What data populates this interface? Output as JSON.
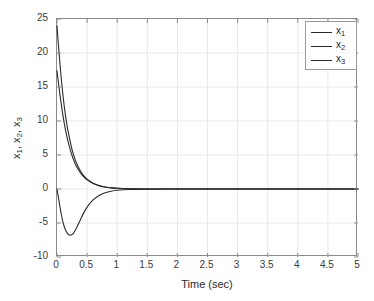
{
  "chart_data": {
    "type": "line",
    "title": "",
    "xlabel": "Time (sec)",
    "ylabel": "x_1, x_2, x_3",
    "xlim": [
      0,
      5
    ],
    "ylim": [
      -10,
      25
    ],
    "xticks": [
      0,
      0.5,
      1,
      1.5,
      2,
      2.5,
      3,
      3.5,
      4,
      4.5,
      5
    ],
    "xtick_labels": [
      "0",
      "0.5",
      "1",
      "1.5",
      "2",
      "2.5",
      "3",
      "3.5",
      "4",
      "4.5",
      "5"
    ],
    "yticks": [
      -10,
      -5,
      0,
      5,
      10,
      15,
      20,
      25
    ],
    "ytick_labels": [
      "-10",
      "-5",
      "0",
      "5",
      "10",
      "15",
      "20",
      "25"
    ],
    "grid": true,
    "legend_position": "top-right",
    "series": [
      {
        "name": "x_1",
        "label_base": "x",
        "label_sub": "1",
        "color": "#2a2a2a",
        "x": [
          0,
          0.02,
          0.05,
          0.08,
          0.12,
          0.16,
          0.2,
          0.25,
          0.3,
          0.35,
          0.4,
          0.45,
          0.5,
          0.6,
          0.7,
          0.8,
          0.9,
          1.0,
          1.2,
          1.5,
          2.0,
          2.5,
          3.0,
          3.5,
          4.0,
          4.5,
          5.0
        ],
        "values": [
          24.0,
          21.6,
          18.3,
          15.4,
          12.2,
          9.7,
          7.8,
          5.8,
          4.35,
          3.3,
          2.5,
          1.9,
          1.45,
          0.85,
          0.5,
          0.3,
          0.18,
          0.1,
          0.04,
          0.01,
          0.0,
          0.0,
          0.0,
          0.0,
          0.0,
          0.0,
          0.0
        ]
      },
      {
        "name": "x_2",
        "label_base": "x",
        "label_sub": "2",
        "color": "#2a2a2a",
        "x": [
          0,
          0.02,
          0.05,
          0.08,
          0.12,
          0.16,
          0.2,
          0.25,
          0.3,
          0.35,
          0.4,
          0.45,
          0.5,
          0.6,
          0.7,
          0.8,
          0.9,
          1.0,
          1.2,
          1.5,
          2.0,
          2.5,
          3.0,
          3.5,
          4.0,
          4.5,
          5.0
        ],
        "values": [
          17.4,
          15.9,
          13.8,
          11.9,
          9.7,
          7.9,
          6.4,
          4.9,
          3.75,
          2.9,
          2.25,
          1.75,
          1.35,
          0.8,
          0.48,
          0.29,
          0.17,
          0.1,
          0.04,
          0.01,
          0.0,
          0.0,
          0.0,
          0.0,
          0.0,
          0.0,
          0.0
        ]
      },
      {
        "name": "x_3",
        "label_base": "x",
        "label_sub": "3",
        "color": "#2a2a2a",
        "x": [
          0,
          0.03,
          0.06,
          0.1,
          0.14,
          0.18,
          0.22,
          0.27,
          0.32,
          0.38,
          0.45,
          0.52,
          0.6,
          0.7,
          0.8,
          0.9,
          1.0,
          1.2,
          1.5,
          2.0,
          2.5,
          3.0,
          3.5,
          4.0,
          4.5,
          5.0
        ],
        "values": [
          0.0,
          -1.6,
          -3.2,
          -4.9,
          -6.0,
          -6.6,
          -6.8,
          -6.55,
          -5.8,
          -4.7,
          -3.4,
          -2.4,
          -1.6,
          -0.95,
          -0.55,
          -0.32,
          -0.19,
          -0.07,
          -0.02,
          0.0,
          0.0,
          0.0,
          0.0,
          0.0,
          0.0,
          0.0
        ]
      }
    ],
    "annotations": []
  },
  "axis": {
    "xlabel_text": "Time (sec)"
  },
  "legend": {
    "entries": [
      {
        "base": "x",
        "sub": "1"
      },
      {
        "base": "x",
        "sub": "2"
      },
      {
        "base": "x",
        "sub": "3"
      }
    ]
  },
  "style": {
    "axis_color": "#8a8a8a",
    "grid_color": "#e8e8e8",
    "text_color": "#2b2b2b",
    "curve_color": "#2a2a2a",
    "background": "#ffffff"
  }
}
